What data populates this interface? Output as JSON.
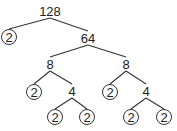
{
  "nodes": [
    {
      "id": "n128",
      "label": "128",
      "prime": false
    },
    {
      "id": "n2a",
      "label": "2",
      "prime": true
    },
    {
      "id": "n64",
      "label": "64",
      "prime": false
    },
    {
      "id": "n8a",
      "label": "8",
      "prime": false
    },
    {
      "id": "n8b",
      "label": "8",
      "prime": false
    },
    {
      "id": "n2b",
      "label": "2",
      "prime": true
    },
    {
      "id": "n4a",
      "label": "4",
      "prime": false
    },
    {
      "id": "n2c",
      "label": "2",
      "prime": true
    },
    {
      "id": "n4b",
      "label": "4",
      "prime": false
    },
    {
      "id": "n2d",
      "label": "2",
      "prime": true
    },
    {
      "id": "n2e",
      "label": "2",
      "prime": true
    },
    {
      "id": "n2f",
      "label": "2",
      "prime": true
    },
    {
      "id": "n2g",
      "label": "2",
      "prime": true
    }
  ],
  "edges": [
    [
      "n128",
      "n2a"
    ],
    [
      "n128",
      "n64"
    ],
    [
      "n64",
      "n8a"
    ],
    [
      "n64",
      "n8b"
    ],
    [
      "n8a",
      "n2b"
    ],
    [
      "n8a",
      "n4a"
    ],
    [
      "n8b",
      "n2c"
    ],
    [
      "n8b",
      "n4b"
    ],
    [
      "n4a",
      "n2d"
    ],
    [
      "n4a",
      "n2e"
    ],
    [
      "n4b",
      "n2f"
    ],
    [
      "n4b",
      "n2g"
    ]
  ]
}
